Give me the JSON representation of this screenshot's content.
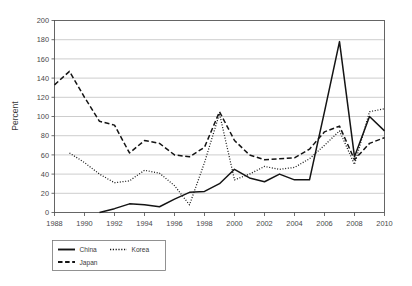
{
  "chart_data": {
    "type": "line",
    "title": "",
    "xlabel": "",
    "ylabel": "Percent",
    "xlim": [
      1988,
      2010
    ],
    "ylim": [
      0,
      200
    ],
    "ytick_step": 20,
    "xtick_step": 2,
    "grid": true,
    "legend_position": "below-left",
    "x_ticks": [
      "1988",
      "1990",
      "1992",
      "1994",
      "1996",
      "1998",
      "2000",
      "2002",
      "2004",
      "2006",
      "2008",
      "2010"
    ],
    "y_ticks": [
      "0",
      "20",
      "40",
      "60",
      "80",
      "100",
      "120",
      "140",
      "160",
      "180",
      "200"
    ],
    "series": [
      {
        "name": "China",
        "style": "solid",
        "x": [
          1991,
          1992,
          1993,
          1994,
          1995,
          1996,
          1997,
          1998,
          1999,
          2000,
          2001,
          2002,
          2003,
          2004,
          2005,
          2006,
          2007,
          2008,
          2009,
          2010
        ],
        "values": [
          0,
          4,
          9,
          8,
          6,
          14,
          21,
          22,
          30,
          45,
          36,
          32,
          40,
          34,
          34,
          105,
          178,
          58,
          100,
          85
        ]
      },
      {
        "name": "Korea",
        "style": "dotted",
        "x": [
          1989,
          1990,
          1991,
          1992,
          1993,
          1994,
          1995,
          1996,
          1997,
          1998,
          1999,
          2000,
          2001,
          2002,
          2003,
          2004,
          2005,
          2006,
          2007,
          2008,
          2009,
          2010
        ],
        "values": [
          62,
          52,
          40,
          31,
          33,
          44,
          41,
          28,
          8,
          52,
          103,
          34,
          40,
          48,
          45,
          47,
          56,
          70,
          85,
          50,
          105,
          108
        ]
      },
      {
        "name": "Japan",
        "style": "dashed",
        "x": [
          1988,
          1989,
          1990,
          1991,
          1992,
          1993,
          1994,
          1995,
          1996,
          1997,
          1998,
          1999,
          2000,
          2001,
          2002,
          2003,
          2004,
          2005,
          2006,
          2007,
          2008,
          2009,
          2010
        ],
        "values": [
          133,
          147,
          120,
          95,
          91,
          62,
          75,
          72,
          60,
          58,
          68,
          105,
          75,
          60,
          55,
          56,
          57,
          66,
          84,
          90,
          55,
          72,
          78
        ]
      }
    ],
    "legend": [
      {
        "label": "China",
        "style": "solid"
      },
      {
        "label": "Korea",
        "style": "dotted"
      },
      {
        "label": "Japan",
        "style": "dashed"
      }
    ]
  }
}
